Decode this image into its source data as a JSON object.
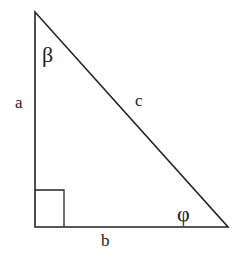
{
  "diagram": {
    "sides": {
      "a": "a",
      "b": "b",
      "c": "c"
    },
    "angles": {
      "top": "β",
      "bottom_right": "φ"
    },
    "right_angle_marker": true,
    "colors": {
      "stroke": "#222222",
      "background": "#ffffff"
    }
  }
}
